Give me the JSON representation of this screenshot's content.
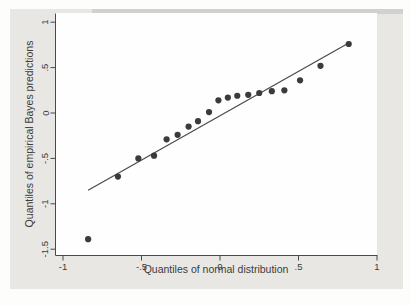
{
  "figure": {
    "page_background": "#fdfdfc",
    "figure_background": "#e8e7e4",
    "top_shadow": "#d2d1ce",
    "plot_background": "#fefefe"
  },
  "colors": {
    "marker": "#3b3b3b",
    "reference_line": "#4a4a4a",
    "axis": "#4a4a4a",
    "text": "#3c3c3c"
  },
  "chart_data": {
    "type": "scatter",
    "title": "",
    "xlabel": "Quantiles of normal distribution",
    "ylabel": "Quantiles of empirical Bayes predictions",
    "xlim": [
      -1.05,
      1.05
    ],
    "ylim": [
      -1.56,
      1.09
    ],
    "grid": false,
    "legend_position": "none",
    "x_ticks": {
      "values": [
        -1,
        -0.5,
        0,
        0.5,
        1
      ],
      "labels": [
        "-1",
        "-.5",
        "0",
        ".5",
        "1"
      ]
    },
    "y_ticks": {
      "values": [
        1,
        0.5,
        0,
        -0.5,
        -1,
        -1.5
      ],
      "labels": [
        "1",
        ".5",
        "0",
        "-.5",
        "-1",
        "-1.5"
      ]
    },
    "series": [
      {
        "name": "empirical Bayes predictions",
        "type": "scatter",
        "points": [
          [
            -0.84,
            -1.39
          ],
          [
            -0.65,
            -0.7
          ],
          [
            -0.52,
            -0.5
          ],
          [
            -0.42,
            -0.47
          ],
          [
            -0.34,
            -0.29
          ],
          [
            -0.27,
            -0.24
          ],
          [
            -0.2,
            -0.15
          ],
          [
            -0.14,
            -0.09
          ],
          [
            -0.07,
            0.01
          ],
          [
            -0.01,
            0.14
          ],
          [
            0.05,
            0.17
          ],
          [
            0.11,
            0.19
          ],
          [
            0.18,
            0.2
          ],
          [
            0.25,
            0.22
          ],
          [
            0.33,
            0.24
          ],
          [
            0.41,
            0.25
          ],
          [
            0.51,
            0.36
          ],
          [
            0.64,
            0.52
          ],
          [
            0.82,
            0.76
          ]
        ]
      },
      {
        "name": "normal reference line",
        "type": "line",
        "points": [
          [
            -0.84,
            -0.85
          ],
          [
            0.82,
            0.77
          ]
        ]
      }
    ]
  }
}
